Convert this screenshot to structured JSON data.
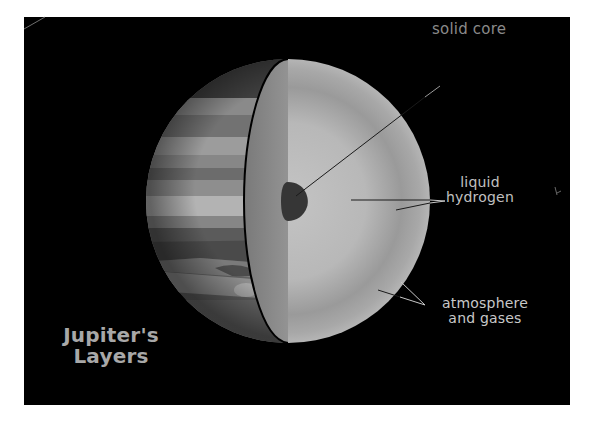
{
  "diagram": {
    "title_line1": "Jupiter's",
    "title_line2": "Layers",
    "labels": {
      "solid_core": "solid core",
      "liquid_hydrogen_line1": "liquid",
      "liquid_hydrogen_line2": "hydrogen",
      "atmosphere_line1": "atmosphere",
      "atmosphere_line2": "and gases"
    },
    "colors": {
      "background": "#000000",
      "page": "#ffffff",
      "label_text": "#b4b4b4",
      "core": "#3a3a3a",
      "interior_light": "#bdbdbd",
      "interior_shadow": "#8e8e8e",
      "cut_face": "#8a8a8a",
      "outline": "#000000"
    },
    "layers": [
      "solid core",
      "liquid hydrogen",
      "atmosphere and gases"
    ]
  }
}
